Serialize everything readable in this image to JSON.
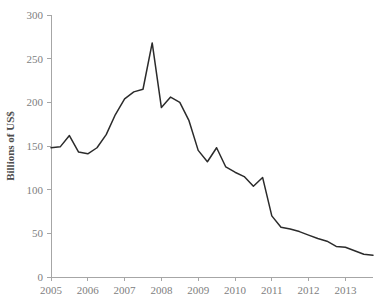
{
  "chart_data": {
    "type": "line",
    "title": "",
    "subtitle": "",
    "xlabel": "",
    "ylabel": "Billions of US$",
    "xlim": [
      2005.0,
      2013.75
    ],
    "ylim": [
      0,
      300
    ],
    "grid": false,
    "legend": null,
    "legend_position": "none",
    "y_ticks": [
      0,
      50,
      100,
      150,
      200,
      250,
      300
    ],
    "y_tick_labels": [
      "0",
      "50",
      "100",
      "150",
      "200",
      "250",
      "300"
    ],
    "x_ticks": [
      2005,
      2006,
      2007,
      2008,
      2009,
      2010,
      2011,
      2012,
      2013
    ],
    "x_tick_labels": [
      "2005",
      "2006",
      "2007",
      "2008",
      "2009",
      "2010",
      "2011",
      "2012",
      "2013"
    ],
    "series": [
      {
        "name": "Billions of US$",
        "color": "#2b2b2b",
        "x": [
          2005.0,
          2005.25,
          2005.5,
          2005.75,
          2006.0,
          2006.25,
          2006.5,
          2006.75,
          2007.0,
          2007.25,
          2007.5,
          2007.75,
          2008.0,
          2008.25,
          2008.5,
          2008.75,
          2009.0,
          2009.25,
          2009.5,
          2009.75,
          2010.0,
          2010.25,
          2010.5,
          2010.75,
          2011.0,
          2011.25,
          2011.5,
          2011.75,
          2012.0,
          2012.25,
          2012.5,
          2012.75,
          2013.0,
          2013.25,
          2013.5,
          2013.75
        ],
        "values": [
          148,
          149,
          162,
          143,
          141,
          148,
          163,
          186,
          204,
          212,
          215,
          268,
          194,
          206,
          200,
          179,
          145,
          132,
          148,
          126,
          120,
          115,
          104,
          114,
          70,
          57,
          55,
          52,
          48,
          44,
          41,
          35,
          34,
          30,
          26,
          25
        ]
      }
    ]
  }
}
